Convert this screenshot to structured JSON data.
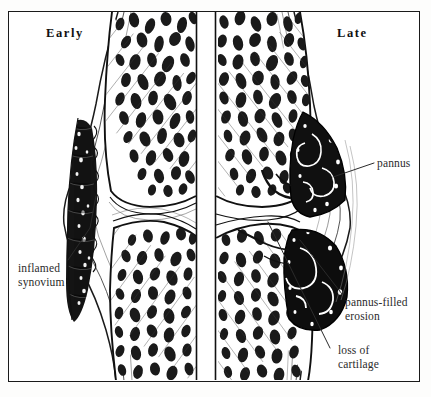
{
  "figure": {
    "style": "pen-and-ink engraving / stipple-hatch medical illustration",
    "frame_color": "#1a1a1a",
    "ink_color": "#111111",
    "paper_color": "#ffffff",
    "label_color": "#2b2b2b"
  },
  "headers": {
    "left": "Early",
    "right": "Late"
  },
  "labels": {
    "pannus": "pannus",
    "inflamed_synovium_line1": "inflamed",
    "inflamed_synovium_line2": "synovium",
    "pannus_filled_erosion_line1": "pannus-filled",
    "pannus_filled_erosion_line2": "erosion",
    "loss_of_cartilage_line1": "loss of",
    "loss_of_cartilage_line2": "cartilage"
  },
  "anatomy": {
    "left_panel": "early rheumatoid arthritis — joint space preserved, synovium thickened and inflamed",
    "right_panel": "late rheumatoid arthritis — cartilage destroyed, pannus filling marginal erosions",
    "structures": [
      "femoral epiphysis (upper bone, trabecular)",
      "tibial epiphysis (lower bone, trabecular)",
      "articular cartilage",
      "joint cavity",
      "synovial membrane",
      "joint capsule",
      "pannus",
      "marginal erosion"
    ]
  }
}
